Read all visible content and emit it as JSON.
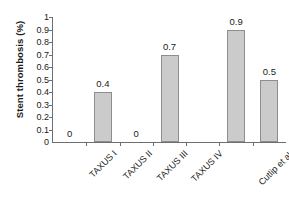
{
  "chart_data": {
    "type": "bar",
    "title": "",
    "xlabel": "",
    "ylabel": "Stent thrombosis (%)",
    "categories": [
      "TAXUS I",
      "TAXUS II",
      "TAXUS III",
      "TAXUS IV",
      "",
      "Cutlip et al.",
      "Orford et al."
    ],
    "values": [
      0,
      0.4,
      0,
      0.7,
      null,
      0.9,
      0.5
    ],
    "value_labels": [
      "0",
      "0.4",
      "0",
      "0.7",
      "",
      "0.9",
      "0.5"
    ],
    "ylim": [
      0,
      1
    ],
    "ytick_labels": [
      "1",
      "0.9",
      "0.8",
      "0.7",
      "0.6",
      "0.5",
      "0.4",
      "0.3",
      "0.2",
      "0.1",
      "0"
    ],
    "ytick_values": [
      1,
      0.9,
      0.8,
      0.7,
      0.6,
      0.5,
      0.4,
      0.3,
      0.2,
      0.1,
      0
    ],
    "grid": false,
    "legend": false,
    "bar_color": "#cbcbcb",
    "bar_border_color": "#8e8e8e",
    "axis_color": "#6e6e6e"
  }
}
